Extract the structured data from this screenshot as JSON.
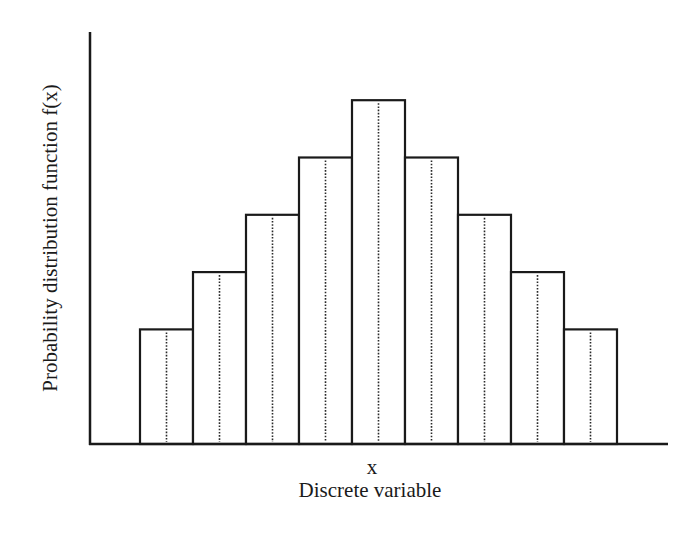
{
  "chart_data": {
    "type": "bar",
    "subtype": "histogram",
    "title": "",
    "xlabel_symbol": "x",
    "xlabel": "Discrete variable",
    "ylabel": "Probability distribution function f(x)",
    "categories": [
      "1",
      "2",
      "3",
      "4",
      "5",
      "6",
      "7",
      "8",
      "9"
    ],
    "values": [
      2,
      3,
      4,
      5,
      6,
      5,
      4,
      3,
      2
    ],
    "value_note": "relative heights (no tick labels shown); symmetric triangular distribution",
    "ylim": [
      0,
      7
    ],
    "grid": false,
    "legend": null,
    "bar_style": {
      "fill": "#ffffff",
      "stroke": "#1a1a1a",
      "center_line": "dotted"
    }
  },
  "layout": {
    "axis_left": 90,
    "axis_top": 32,
    "axis_right": 668,
    "baseline": 444,
    "bar_start": 140,
    "bar_width": 53,
    "unit_px": 57.3
  }
}
